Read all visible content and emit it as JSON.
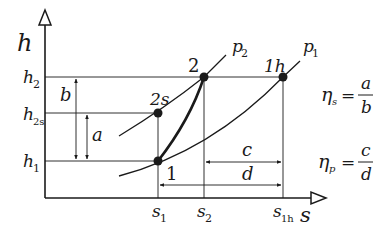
{
  "diagram": {
    "type": "h-s diagram (Mollier) for compression process",
    "axes": {
      "y_label": "h",
      "x_label": "s",
      "y_ticks": [
        {
          "main": "h",
          "sub": "2"
        },
        {
          "main": "h",
          "sub": "2s"
        },
        {
          "main": "h",
          "sub": "1"
        }
      ],
      "x_ticks": [
        {
          "main": "s",
          "sub": "1"
        },
        {
          "main": "s",
          "sub": "2"
        },
        {
          "main": "s",
          "sub": "1h"
        }
      ]
    },
    "isobars": [
      {
        "main": "p",
        "sub": "2"
      },
      {
        "main": "p",
        "sub": "1"
      }
    ],
    "points": [
      {
        "label": "1"
      },
      {
        "label": "2"
      },
      {
        "label": "2s"
      },
      {
        "label": "1h"
      }
    ],
    "dimensions": {
      "a": "a",
      "b": "b",
      "c": "c",
      "d": "d"
    },
    "formulas": [
      {
        "lhs_main": "η",
        "lhs_sub": "s",
        "eq": "=",
        "num": "a",
        "den": "b"
      },
      {
        "lhs_main": "η",
        "lhs_sub": "p",
        "eq": "=",
        "num": "c",
        "den": "d"
      }
    ],
    "colors": {
      "line": "#1a1a1a",
      "background": "#ffffff"
    }
  }
}
